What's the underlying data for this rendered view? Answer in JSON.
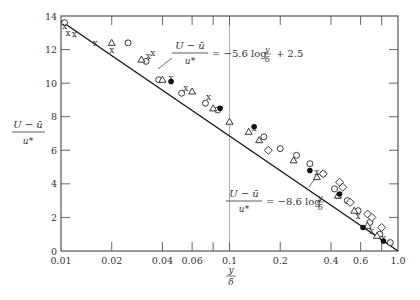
{
  "chart_data": {
    "type": "scatter",
    "title": "",
    "xlabel": "y/δ",
    "ylabel": "(U − ū)/u*",
    "xscale": "log",
    "xlim": [
      0.01,
      1.0
    ],
    "ylim": [
      0,
      14
    ],
    "grid": false,
    "x_ticks": [
      0.01,
      0.02,
      0.04,
      0.06,
      0.08,
      0.1,
      0.2,
      0.4,
      0.6,
      0.8,
      1.0
    ],
    "x_tick_labels": [
      "0.01",
      "0.02",
      "0.04",
      "0.06",
      "",
      "0.1",
      "0.2",
      "0.4",
      "0.6",
      "",
      "1.0"
    ],
    "y_ticks": [
      0,
      2,
      4,
      6,
      8,
      10,
      12,
      14
    ],
    "y_tick_labels": [
      "0",
      "2",
      "4",
      "6",
      "8",
      "10",
      "12",
      "14"
    ],
    "vertical_reference_line": 0.1,
    "lines": [
      {
        "name": "outer-law-fit",
        "label_parts": [
          "U − ū",
          "u*",
          "= −5.6 log",
          "y",
          "δ",
          "+ 2.5"
        ],
        "x": [
          0.01,
          1.0
        ],
        "y": [
          13.7,
          0.0
        ]
      }
    ],
    "annotations": [
      {
        "text": "(U − ū)/u* = −5.6 log(y/δ) + 2.5",
        "x": 0.075,
        "y": 10.6
      },
      {
        "text": "(U − ū)/u* = −8.6 log(y/δ)",
        "x": 0.22,
        "y": 3.3
      }
    ],
    "series": [
      {
        "name": "circles",
        "marker": "o",
        "points": [
          [
            0.0105,
            13.6
          ],
          [
            0.025,
            12.4
          ],
          [
            0.032,
            11.3
          ],
          [
            0.038,
            10.2
          ],
          [
            0.052,
            9.4
          ],
          [
            0.072,
            8.8
          ],
          [
            0.085,
            8.4
          ],
          [
            0.16,
            6.8
          ],
          [
            0.2,
            6.1
          ],
          [
            0.25,
            5.7
          ],
          [
            0.3,
            5.2
          ],
          [
            0.36,
            4.6
          ],
          [
            0.42,
            3.7
          ],
          [
            0.5,
            3.0
          ],
          [
            0.58,
            2.4
          ],
          [
            0.68,
            1.7
          ],
          [
            0.78,
            1.0
          ],
          [
            0.9,
            0.5
          ]
        ]
      },
      {
        "name": "crosses",
        "marker": "x",
        "points": [
          [
            0.0105,
            13.4
          ],
          [
            0.011,
            13.0
          ],
          [
            0.012,
            12.9
          ],
          [
            0.016,
            12.4
          ],
          [
            0.02,
            12.0
          ],
          [
            0.033,
            11.6
          ],
          [
            0.035,
            11.8
          ],
          [
            0.045,
            10.3
          ],
          [
            0.055,
            9.7
          ],
          [
            0.075,
            9.2
          ],
          [
            0.14,
            7.3
          ],
          [
            0.33,
            4.7
          ],
          [
            0.44,
            3.3
          ],
          [
            0.58,
            2.1
          ],
          [
            0.7,
            1.2
          ],
          [
            0.82,
            0.8
          ]
        ]
      },
      {
        "name": "triangles",
        "marker": "^",
        "points": [
          [
            0.02,
            12.4
          ],
          [
            0.03,
            11.4
          ],
          [
            0.04,
            10.2
          ],
          [
            0.06,
            9.5
          ],
          [
            0.08,
            8.5
          ],
          [
            0.1,
            7.7
          ],
          [
            0.13,
            7.1
          ],
          [
            0.15,
            6.6
          ],
          [
            0.24,
            5.4
          ],
          [
            0.33,
            4.4
          ],
          [
            0.44,
            3.3
          ],
          [
            0.55,
            2.4
          ],
          [
            0.66,
            1.5
          ],
          [
            0.75,
            0.9
          ]
        ]
      },
      {
        "name": "filled-circles",
        "marker": "●",
        "points": [
          [
            0.045,
            10.1
          ],
          [
            0.088,
            8.5
          ],
          [
            0.14,
            7.4
          ],
          [
            0.3,
            4.8
          ],
          [
            0.45,
            3.4
          ],
          [
            0.62,
            1.4
          ],
          [
            0.82,
            0.6
          ]
        ]
      },
      {
        "name": "diamonds",
        "marker": "◇",
        "points": [
          [
            0.17,
            6.0
          ],
          [
            0.36,
            4.6
          ],
          [
            0.45,
            4.1
          ],
          [
            0.47,
            3.8
          ],
          [
            0.52,
            2.9
          ],
          [
            0.66,
            2.2
          ],
          [
            0.7,
            2.0
          ],
          [
            0.8,
            1.4
          ]
        ]
      }
    ]
  }
}
